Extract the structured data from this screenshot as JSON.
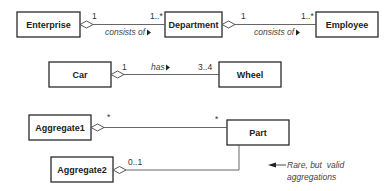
{
  "diagram": {
    "type": "UML class diagram - aggregations",
    "rows": [
      {
        "classes": [
          "Enterprise",
          "Department",
          "Employee"
        ],
        "associations": [
          {
            "whole": "Enterprise",
            "part": "Department",
            "whole_mult": "1",
            "part_mult": "1..*",
            "label": "consists of"
          },
          {
            "whole": "Department",
            "part": "Employee",
            "whole_mult": "1",
            "part_mult": "1..*",
            "label": "consists of"
          }
        ]
      },
      {
        "classes": [
          "Car",
          "Wheel"
        ],
        "associations": [
          {
            "whole": "Car",
            "part": "Wheel",
            "whole_mult": "1",
            "part_mult": "3..4",
            "label": "has"
          }
        ]
      },
      {
        "classes": [
          "Aggregate1",
          "Part",
          "Aggregate2"
        ],
        "associations": [
          {
            "whole": "Aggregate1",
            "part": "Part",
            "whole_mult": "*",
            "part_mult": "*"
          },
          {
            "whole": "Aggregate2",
            "part": "Part",
            "whole_mult": "0..1"
          }
        ]
      }
    ],
    "note": {
      "line1": "Rare, but  valid",
      "line2": "aggregations"
    }
  },
  "classes": {
    "enterprise": "Enterprise",
    "department": "Department",
    "employee": "Employee",
    "car": "Car",
    "wheel": "Wheel",
    "aggregate1": "Aggregate1",
    "part": "Part",
    "aggregate2": "Aggregate2"
  },
  "labels": {
    "ent_dept_whole_mult": "1",
    "ent_dept_part_mult": "1..*",
    "ent_dept_label": "consists of",
    "dept_emp_whole_mult": "1",
    "dept_emp_part_mult": "1..*",
    "dept_emp_label": "consists of",
    "car_wheel_whole_mult": "1",
    "car_wheel_part_mult": "3..4",
    "car_wheel_label": "has",
    "agg1_whole_mult": "*",
    "agg1_part_mult": "*",
    "agg2_whole_mult": "0..1"
  },
  "note": {
    "line1": "Rare, but  valid",
    "line2": "aggregations"
  }
}
